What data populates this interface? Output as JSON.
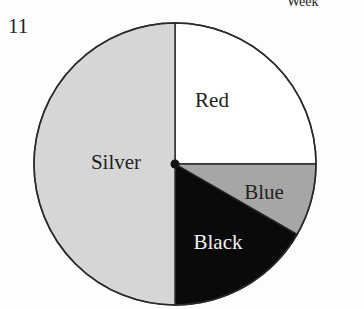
{
  "question_number": "11",
  "header_text": "Week",
  "chart_data": {
    "type": "pie",
    "title": "",
    "categories": [
      "Red",
      "Blue",
      "Black",
      "Silver"
    ],
    "values": [
      25,
      8.33,
      16.67,
      50
    ],
    "angles_deg": [
      90,
      30,
      60,
      180
    ],
    "colors": [
      "#ffffff",
      "#a6a6a6",
      "#0a0a0a",
      "#d6d6d6"
    ],
    "label_colors": [
      "#222222",
      "#222222",
      "#f2f2f2",
      "#222222"
    ],
    "start_angle": "12 o'clock, clockwise",
    "legend": "none (labels inside slices)"
  }
}
